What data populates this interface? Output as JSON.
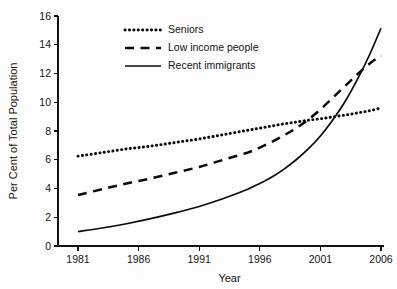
{
  "chart_data": {
    "type": "line",
    "title": "",
    "xlabel": "Year",
    "ylabel": "Per Cent of Total Population",
    "xlim": [
      1979.5,
      2006.5
    ],
    "ylim": [
      0,
      16
    ],
    "grid": false,
    "legend_position": "top-center",
    "x_ticks": [
      "1981",
      "1986",
      "1991",
      "1996",
      "2001",
      "2006"
    ],
    "x_tick_values": [
      1981,
      1986,
      1991,
      1996,
      2001,
      2006
    ],
    "y_ticks": [
      "0",
      "2",
      "4",
      "6",
      "8",
      "10",
      "12",
      "14",
      "16"
    ],
    "y_tick_values": [
      0,
      2,
      4,
      6,
      8,
      10,
      12,
      14,
      16
    ],
    "x": [
      1981,
      1983,
      1985,
      1987,
      1989,
      1991,
      1993,
      1995,
      1996,
      1997,
      1998,
      1999,
      2000,
      2001,
      2002,
      2003,
      2004,
      2005,
      2006
    ],
    "series": [
      {
        "name": "Seniors",
        "style": "dotted",
        "values": [
          6.25,
          6.5,
          6.75,
          6.95,
          7.2,
          7.45,
          7.75,
          8.05,
          8.2,
          8.35,
          8.5,
          8.62,
          8.75,
          8.85,
          8.98,
          9.1,
          9.25,
          9.4,
          9.6
        ]
      },
      {
        "name": "Low income people",
        "style": "dashed",
        "values": [
          3.55,
          3.95,
          4.35,
          4.7,
          5.1,
          5.5,
          6.0,
          6.5,
          6.85,
          7.25,
          7.7,
          8.2,
          8.8,
          9.5,
          10.3,
          11.1,
          11.9,
          12.65,
          13.25
        ]
      },
      {
        "name": "Recent immigrants",
        "style": "solid",
        "values": [
          1.0,
          1.25,
          1.55,
          1.9,
          2.3,
          2.75,
          3.3,
          3.95,
          4.35,
          4.8,
          5.35,
          6.0,
          6.75,
          7.65,
          8.75,
          10.0,
          11.5,
          13.2,
          15.15
        ]
      }
    ],
    "legend": [
      {
        "label": "Seniors",
        "style": "dotted"
      },
      {
        "label": "Low income people",
        "style": "dashed"
      },
      {
        "label": "Recent immigrants",
        "style": "solid"
      }
    ],
    "colors": {
      "line": "#0b0b0b",
      "axis": "#111111",
      "text": "#141414",
      "background": "#fdfdfd"
    }
  }
}
